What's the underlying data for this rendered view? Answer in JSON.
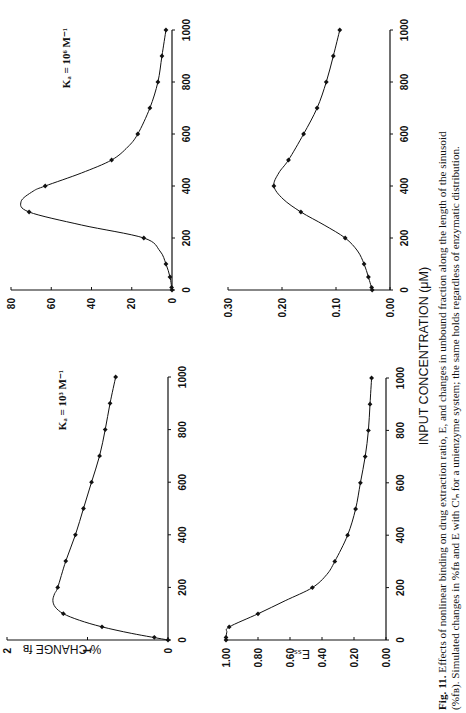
{
  "figure": {
    "shared_xlabel": "INPUT CONCENTRATION (μM)",
    "caption_label": "Fig. 11.",
    "caption_line1": "Effects of nonlinear binding on drug extraction ratio, E, and changes in unbound fraction along the length of the sinusoid",
    "caption_line2": "(%fʙ). Simulated changes in %fʙ and E with Cᴵₙ for a unienzyme system; the same holds regardless of enzymatic distribution."
  },
  "chart_data": [
    {
      "id": "fb-ka3",
      "type": "line",
      "title": "",
      "annotation": "Kₐ = 10³ M⁻¹",
      "xlabel": "INPUT CONCENTRATION (μM)",
      "ylabel": "% CHANGE fʙ",
      "xlim": [
        0,
        1000
      ],
      "ylim": [
        0,
        2
      ],
      "xticks": [
        0,
        200,
        400,
        600,
        800,
        1000
      ],
      "yticks": [
        0,
        1,
        2
      ],
      "ytick_labels": [
        "0",
        "1",
        "2"
      ],
      "grid": false,
      "x": [
        0,
        10,
        50,
        100,
        200,
        300,
        400,
        500,
        600,
        700,
        800,
        900,
        1000
      ],
      "y": [
        0,
        0.17,
        0.82,
        1.3,
        1.37,
        1.27,
        1.15,
        1.05,
        0.95,
        0.85,
        0.78,
        0.72,
        0.65
      ],
      "curve_x": [
        0,
        25,
        50,
        75,
        100,
        125,
        150,
        175,
        200,
        300,
        400,
        500,
        600,
        700,
        800,
        900,
        1000
      ],
      "curve_y": [
        0,
        0.45,
        0.82,
        1.1,
        1.3,
        1.4,
        1.43,
        1.41,
        1.37,
        1.27,
        1.15,
        1.05,
        0.95,
        0.85,
        0.78,
        0.72,
        0.65
      ]
    },
    {
      "id": "ess-ka3",
      "type": "line",
      "annotation": "",
      "xlabel": "INPUT CONCENTRATION (μM)",
      "ylabel": "Eₛₛ",
      "xlim": [
        0,
        1000
      ],
      "ylim": [
        0,
        1
      ],
      "xticks": [
        0,
        200,
        400,
        600,
        800,
        1000
      ],
      "yticks": [
        0,
        0.2,
        0.4,
        0.6,
        0.8,
        1.0
      ],
      "ytick_labels": [
        "0.00",
        "0.20",
        "0.40",
        "0.60",
        "0.80",
        "1.00"
      ],
      "grid": false,
      "x": [
        0,
        10,
        50,
        100,
        200,
        300,
        400,
        500,
        600,
        700,
        800,
        900,
        1000
      ],
      "y": [
        1.0,
        1.0,
        0.98,
        0.8,
        0.46,
        0.32,
        0.24,
        0.19,
        0.16,
        0.13,
        0.11,
        0.1,
        0.09
      ],
      "curve_x": [
        0,
        10,
        30,
        50,
        100,
        150,
        200,
        250,
        300,
        400,
        500,
        600,
        700,
        800,
        900,
        1000
      ],
      "curve_y": [
        1.0,
        1.0,
        0.995,
        0.98,
        0.8,
        0.63,
        0.46,
        0.37,
        0.32,
        0.24,
        0.19,
        0.16,
        0.13,
        0.11,
        0.1,
        0.09
      ]
    },
    {
      "id": "fb-ka6",
      "type": "line",
      "annotation": "Kₐ = 10⁶ M⁻¹",
      "xlabel": "INPUT CONCENTRATION (μM)",
      "ylabel": "% CHANGE fʙ",
      "xlim": [
        0,
        1000
      ],
      "ylim": [
        0,
        80
      ],
      "xticks": [
        0,
        200,
        400,
        600,
        800,
        1000
      ],
      "yticks": [
        0,
        20,
        40,
        60,
        80
      ],
      "ytick_labels": [
        "0",
        "20",
        "40",
        "60",
        "80"
      ],
      "grid": false,
      "x": [
        0,
        10,
        50,
        100,
        200,
        300,
        400,
        500,
        600,
        700,
        800,
        900,
        1000
      ],
      "y": [
        0,
        0.2,
        1,
        3,
        14,
        71,
        63,
        30,
        17,
        11,
        7,
        5,
        3
      ],
      "curve_x": [
        0,
        50,
        100,
        150,
        200,
        250,
        300,
        340,
        380,
        400,
        450,
        500,
        550,
        600,
        700,
        800,
        900,
        1000
      ],
      "curve_y": [
        0,
        1,
        3,
        6,
        14,
        45,
        71,
        75,
        69,
        63,
        45,
        30,
        22,
        17,
        11,
        7,
        5,
        3
      ]
    },
    {
      "id": "ess-ka6",
      "type": "line",
      "annotation": "",
      "xlabel": "INPUT CONCENTRATION (μM)",
      "ylabel": "Eₛₛ",
      "xlim": [
        0,
        1000
      ],
      "ylim": [
        0,
        0.3
      ],
      "xticks": [
        0,
        200,
        400,
        600,
        800,
        1000
      ],
      "yticks": [
        0,
        0.1,
        0.2,
        0.3
      ],
      "ytick_labels": [
        "0.00",
        "0.10",
        "0.20",
        "0.30"
      ],
      "grid": false,
      "x": [
        0,
        10,
        50,
        100,
        200,
        300,
        400,
        500,
        600,
        700,
        800,
        900,
        1000
      ],
      "y": [
        0.033,
        0.034,
        0.04,
        0.048,
        0.083,
        0.165,
        0.215,
        0.188,
        0.16,
        0.135,
        0.118,
        0.105,
        0.093
      ],
      "curve_x": [
        0,
        50,
        100,
        150,
        200,
        250,
        300,
        350,
        400,
        450,
        500,
        600,
        700,
        800,
        900,
        1000
      ],
      "curve_y": [
        0.033,
        0.04,
        0.048,
        0.06,
        0.083,
        0.122,
        0.165,
        0.198,
        0.215,
        0.206,
        0.188,
        0.16,
        0.135,
        0.118,
        0.105,
        0.093
      ]
    }
  ]
}
